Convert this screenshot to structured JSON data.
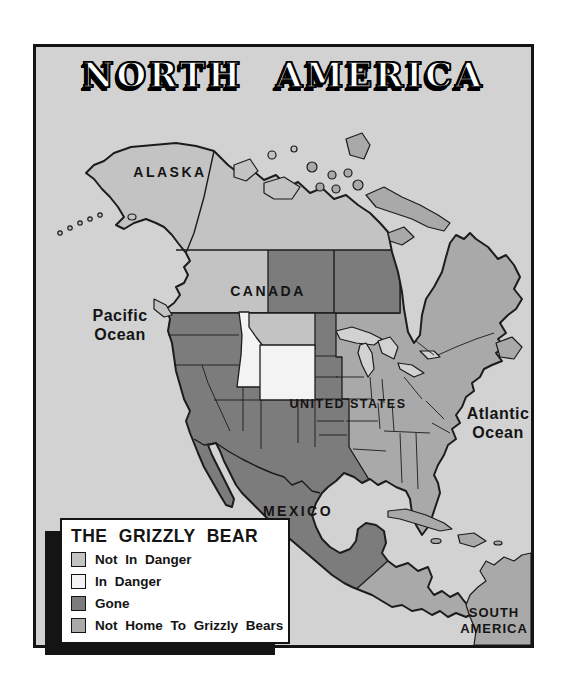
{
  "title": "NORTH AMERICA",
  "colors": {
    "page": "#ffffff",
    "ocean": "#d2d2d2",
    "frame": "#141414",
    "not_in_danger": "#c3c3c3",
    "in_danger": "#f3f3f3",
    "gone": "#7c7c7c",
    "not_home": "#a9a9a9",
    "legend_bg": "#ffffff",
    "legend_shadow": "#141414"
  },
  "map": {
    "labels": {
      "alaska": "ALASKA",
      "canada": "CANADA",
      "united_states": "UNITED STATES",
      "mexico": "MEXICO",
      "pacific_line1": "Pacific",
      "pacific_line2": "Ocean",
      "atlantic_line1": "Atlantic",
      "atlantic_line2": "Ocean",
      "south_america_line1": "SOUTH",
      "south_america_line2": "AMERICA"
    }
  },
  "legend": {
    "title": "THE GRIZZLY BEAR",
    "items": [
      {
        "label": "Not In Danger",
        "swatch": "#c3c3c3"
      },
      {
        "label": "In Danger",
        "swatch": "#f3f3f3"
      },
      {
        "label": "Gone",
        "swatch": "#7c7c7c"
      },
      {
        "label": "Not Home To Grizzly Bears",
        "swatch": "#a9a9a9"
      }
    ]
  }
}
